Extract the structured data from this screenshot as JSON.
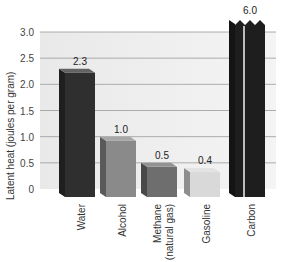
{
  "chart_data": {
    "type": "bar",
    "title": "",
    "xlabel": "",
    "ylabel": "Latent heat (joules per gram)",
    "ylim": [
      0,
      3.0
    ],
    "yticks": [
      "0",
      "0.5",
      "1.0",
      "1.5",
      "2.0",
      "2.5",
      "3.0"
    ],
    "grid": true,
    "legend": null,
    "categories": [
      "Water",
      "Alcohol",
      "Methane (natural gas)",
      "Gasoline",
      "Carbon"
    ],
    "category_lines": [
      [
        "Water"
      ],
      [
        "Alcohol"
      ],
      [
        "Methane",
        "(natural gas)"
      ],
      [
        "Gasoline"
      ],
      [
        "Carbon"
      ]
    ],
    "values": [
      2.3,
      1.0,
      0.5,
      0.4,
      6.0
    ],
    "value_labels": [
      "2.3",
      "1.0",
      "0.5",
      "0.4",
      "6.0"
    ],
    "annotations": [
      "Carbon bar is truncated (broken top) because 6.0 exceeds axis max 3.0"
    ],
    "colors": [
      "#2f2f2f",
      "#8a8a8a",
      "#6e6e6e",
      "#d9d9d9",
      "#1e1e1e"
    ]
  }
}
